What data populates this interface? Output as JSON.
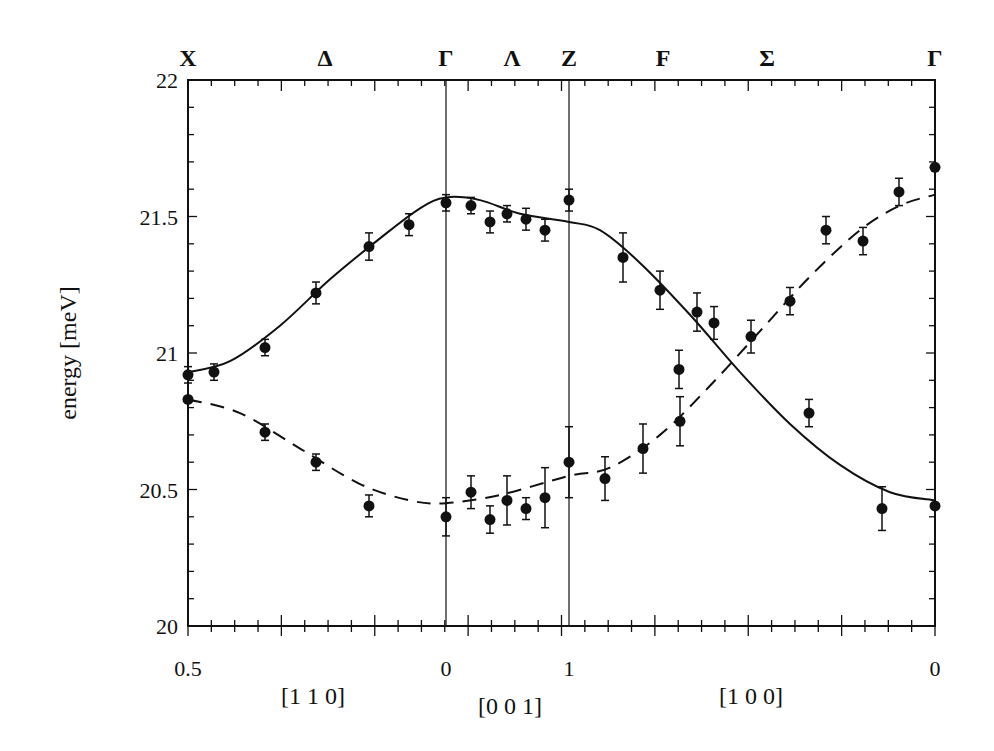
{
  "chart_data": {
    "type": "scatter",
    "title": "",
    "ylabel": "energy [meV]",
    "xlabel": "",
    "ylim": [
      20,
      22
    ],
    "yticks": [
      {
        "value": 20,
        "label": "20"
      },
      {
        "value": 20.5,
        "label": "20.5"
      },
      {
        "value": 21,
        "label": "21"
      },
      {
        "value": 21.5,
        "label": "21.5"
      },
      {
        "value": 22,
        "label": "22"
      }
    ],
    "grid": false,
    "legend": null,
    "top_labels": [
      {
        "label": "X",
        "px": 188
      },
      {
        "label": "Δ",
        "px": 325
      },
      {
        "label": "Γ",
        "px": 446
      },
      {
        "label": "Λ",
        "px": 512
      },
      {
        "label": "Z",
        "px": 569
      },
      {
        "label": "F",
        "px": 663
      },
      {
        "label": "Σ",
        "px": 767
      },
      {
        "label": "Γ",
        "px": 935
      }
    ],
    "bottom_tick_labels": [
      {
        "label": "0.5",
        "px": 188
      },
      {
        "label": "0",
        "px": 446
      },
      {
        "label": "1",
        "px": 569
      },
      {
        "label": "0",
        "px": 935
      }
    ],
    "direction_labels": [
      {
        "label": "[1 1 0]",
        "px": 313
      },
      {
        "label": "[0 0 1]",
        "px": 510
      },
      {
        "label": "[1 0 0]",
        "px": 751
      }
    ],
    "segments": [
      {
        "name": "X-Γ",
        "direction": "[1 1 0]",
        "from": 0.5,
        "to": 0
      },
      {
        "name": "Γ-Z",
        "direction": "[0 0 1]",
        "from": 0,
        "to": 1
      },
      {
        "name": "Z-Γ",
        "direction": "[1 0 0]",
        "from": 1,
        "to": 0
      }
    ],
    "vertical_lines_px": [
      446,
      569
    ],
    "series": [
      {
        "name": "upper branch (solid line)",
        "line_style": "solid",
        "points": [
          {
            "px": 188,
            "y": 20.92,
            "err": 0.03
          },
          {
            "px": 214,
            "y": 20.93,
            "err": 0.03
          },
          {
            "px": 265,
            "y": 21.02,
            "err": 0.03
          },
          {
            "px": 316,
            "y": 21.22,
            "err": 0.04
          },
          {
            "px": 369,
            "y": 21.39,
            "err": 0.05
          },
          {
            "px": 409,
            "y": 21.47,
            "err": 0.04
          },
          {
            "px": 446,
            "y": 21.55,
            "err": 0.03
          },
          {
            "px": 471,
            "y": 21.54,
            "err": 0.03
          },
          {
            "px": 490,
            "y": 21.48,
            "err": 0.04
          },
          {
            "px": 507,
            "y": 21.51,
            "err": 0.03
          },
          {
            "px": 526,
            "y": 21.49,
            "err": 0.04
          },
          {
            "px": 545,
            "y": 21.45,
            "err": 0.04
          },
          {
            "px": 569,
            "y": 21.56,
            "err": 0.04
          },
          {
            "px": 623,
            "y": 21.35,
            "err": 0.09
          },
          {
            "px": 660,
            "y": 21.23,
            "err": 0.07
          },
          {
            "px": 697,
            "y": 21.15,
            "err": 0.07
          },
          {
            "px": 714,
            "y": 21.11,
            "err": 0.06
          },
          {
            "px": 751,
            "y": 21.06,
            "err": 0.06
          },
          {
            "px": 790,
            "y": 21.19,
            "err": 0.05
          },
          {
            "px": 826,
            "y": 21.45,
            "err": 0.05
          },
          {
            "px": 863,
            "y": 21.41,
            "err": 0.05
          },
          {
            "px": 899,
            "y": 21.59,
            "err": 0.05
          },
          {
            "px": 935,
            "y": 21.68,
            "err": 0.0
          }
        ],
        "curve": [
          [
            188,
            20.93
          ],
          [
            230,
            20.97
          ],
          [
            280,
            21.1
          ],
          [
            330,
            21.27
          ],
          [
            380,
            21.42
          ],
          [
            420,
            21.53
          ],
          [
            446,
            21.57
          ],
          [
            480,
            21.56
          ],
          [
            520,
            21.51
          ],
          [
            569,
            21.48
          ],
          [
            600,
            21.45
          ],
          [
            640,
            21.33
          ],
          [
            690,
            21.14
          ],
          [
            740,
            20.93
          ],
          [
            790,
            20.74
          ],
          [
            840,
            20.59
          ],
          [
            890,
            20.49
          ],
          [
            935,
            20.46
          ]
        ]
      },
      {
        "name": "lower branch (dashed line)",
        "line_style": "dashed",
        "points": [
          {
            "px": 188,
            "y": 20.83,
            "err": 0.0
          },
          {
            "px": 265,
            "y": 20.71,
            "err": 0.03
          },
          {
            "px": 316,
            "y": 20.6,
            "err": 0.03
          },
          {
            "px": 369,
            "y": 20.44,
            "err": 0.04
          },
          {
            "px": 446,
            "y": 20.4,
            "err": 0.07
          },
          {
            "px": 471,
            "y": 20.49,
            "err": 0.06
          },
          {
            "px": 490,
            "y": 20.39,
            "err": 0.05
          },
          {
            "px": 507,
            "y": 20.46,
            "err": 0.09
          },
          {
            "px": 526,
            "y": 20.43,
            "err": 0.04
          },
          {
            "px": 545,
            "y": 20.47,
            "err": 0.11
          },
          {
            "px": 569,
            "y": 20.6,
            "err": 0.13
          },
          {
            "px": 605,
            "y": 20.54,
            "err": 0.08
          },
          {
            "px": 643,
            "y": 20.65,
            "err": 0.09
          },
          {
            "px": 680,
            "y": 20.75,
            "err": 0.09
          },
          {
            "px": 679,
            "y": 20.94,
            "err": 0.07
          },
          {
            "px": 809,
            "y": 20.78,
            "err": 0.05
          },
          {
            "px": 882,
            "y": 20.43,
            "err": 0.08
          },
          {
            "px": 935,
            "y": 20.44,
            "err": 0.0
          }
        ],
        "curve": [
          [
            188,
            20.83
          ],
          [
            240,
            20.78
          ],
          [
            300,
            20.65
          ],
          [
            360,
            20.52
          ],
          [
            410,
            20.46
          ],
          [
            446,
            20.45
          ],
          [
            500,
            20.48
          ],
          [
            569,
            20.55
          ],
          [
            610,
            20.58
          ],
          [
            660,
            20.7
          ],
          [
            710,
            20.88
          ],
          [
            760,
            21.08
          ],
          [
            810,
            21.28
          ],
          [
            860,
            21.45
          ],
          [
            900,
            21.54
          ],
          [
            935,
            21.58
          ]
        ]
      }
    ]
  },
  "plot_area_px": {
    "left": 188,
    "right": 935,
    "top": 80,
    "bottom": 626
  }
}
